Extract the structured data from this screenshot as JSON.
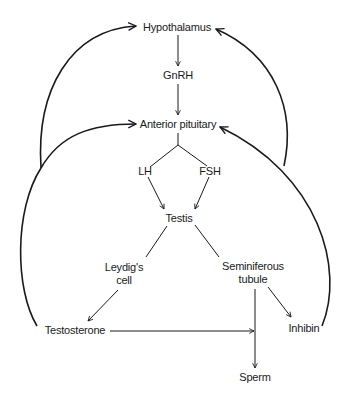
{
  "diagram": {
    "type": "flowchart",
    "title": "",
    "colors": {
      "line": "#1a1a1a",
      "text": "#1a1a1a",
      "background": "#ffffff"
    },
    "nodes": {
      "hypothalamus": {
        "label": "Hypothalamus"
      },
      "gnrh": {
        "label": "GnRH"
      },
      "anterior_pituitary": {
        "label": "Anterior pituitary"
      },
      "lh": {
        "label": "LH"
      },
      "fsh": {
        "label": "FSH"
      },
      "testis": {
        "label": "Testis"
      },
      "leydig": {
        "line1": "Leydig's",
        "line2": "cell"
      },
      "seminiferous": {
        "line1": "Seminiferous",
        "line2": "tubule"
      },
      "testosterone": {
        "label": "Testosterone"
      },
      "inhibin": {
        "label": "Inhibin"
      },
      "sperm": {
        "label": "Sperm"
      }
    },
    "edges": [
      {
        "from": "Hypothalamus",
        "to": "GnRH",
        "type": "arrow"
      },
      {
        "from": "GnRH",
        "to": "Anterior pituitary",
        "type": "arrow"
      },
      {
        "from": "Anterior pituitary",
        "to": "LH",
        "type": "branch"
      },
      {
        "from": "Anterior pituitary",
        "to": "FSH",
        "type": "branch"
      },
      {
        "from": "LH",
        "to": "Testis",
        "type": "arrow"
      },
      {
        "from": "FSH",
        "to": "Testis",
        "type": "arrow"
      },
      {
        "from": "Testis",
        "to": "Leydig's cell",
        "type": "line"
      },
      {
        "from": "Testis",
        "to": "Seminiferous tubule",
        "type": "line"
      },
      {
        "from": "Leydig's cell",
        "to": "Testosterone",
        "type": "arrow"
      },
      {
        "from": "Testosterone",
        "to": "Seminiferous tubule",
        "type": "arrow"
      },
      {
        "from": "Seminiferous tubule",
        "to": "Sperm",
        "type": "arrow"
      },
      {
        "from": "Seminiferous tubule",
        "to": "Inhibin",
        "type": "arrow"
      },
      {
        "from": "Testosterone",
        "to": "Hypothalamus",
        "type": "feedback-arc"
      },
      {
        "from": "Testosterone",
        "to": "Anterior pituitary",
        "type": "feedback-arc"
      },
      {
        "from": "Inhibin",
        "to": "Hypothalamus",
        "type": "feedback-arc"
      },
      {
        "from": "Inhibin",
        "to": "Anterior pituitary",
        "type": "feedback-arc"
      }
    ]
  }
}
